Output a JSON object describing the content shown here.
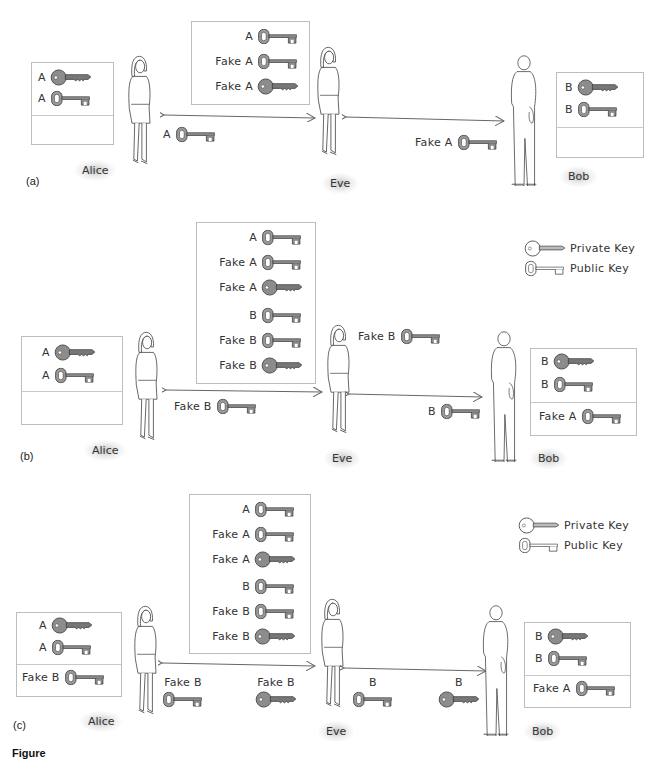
{
  "colors": {
    "private_key_fill": "#8c8c8c",
    "private_key_stroke": "#4a4a4a",
    "public_key_fill": "#9a9a9a",
    "box_border": "#bdbdbd",
    "arrow": "#666666",
    "name_shadow": "#9a9a9a"
  },
  "legend": {
    "private_label": "Private Key",
    "public_label": "Public Key"
  },
  "panels": [
    {
      "tag": "(a)",
      "names": {
        "alice": "Alice",
        "eve": "Eve",
        "bob": "Bob"
      },
      "alice_box": {
        "top_rows": [
          {
            "label": "A",
            "key": "private"
          },
          {
            "label": "A",
            "key": "public"
          }
        ],
        "bottom_rows": []
      },
      "eve_box": {
        "rows": [
          {
            "label": "A",
            "key": "public"
          },
          {
            "label": "Fake A",
            "key": "public"
          },
          {
            "label": "Fake A",
            "key": "private"
          }
        ]
      },
      "bob_box": {
        "top_rows": [
          {
            "label": "B",
            "key": "private"
          },
          {
            "label": "B",
            "key": "public"
          }
        ],
        "bottom_rows": []
      },
      "transfers": [
        {
          "label": "A",
          "key": "public",
          "link": "alice-eve"
        },
        {
          "label": "Fake A",
          "key": "public",
          "link": "eve-bob"
        }
      ]
    },
    {
      "tag": "(b)",
      "names": {
        "alice": "Alice",
        "eve": "Eve",
        "bob": "Bob"
      },
      "alice_box": {
        "top_rows": [
          {
            "label": "A",
            "key": "private"
          },
          {
            "label": "A",
            "key": "public"
          }
        ],
        "bottom_rows": []
      },
      "eve_box": {
        "rows": [
          {
            "label": "A",
            "key": "public"
          },
          {
            "label": "Fake A",
            "key": "public"
          },
          {
            "label": "Fake A",
            "key": "private"
          },
          {
            "label": "B",
            "key": "public"
          },
          {
            "label": "Fake B",
            "key": "public"
          },
          {
            "label": "Fake B",
            "key": "private"
          }
        ]
      },
      "bob_box": {
        "top_rows": [
          {
            "label": "B",
            "key": "private"
          },
          {
            "label": "B",
            "key": "public"
          }
        ],
        "bottom_rows": [
          {
            "label": "Fake A",
            "key": "public"
          }
        ]
      },
      "transfers": [
        {
          "label": "Fake B",
          "key": "public",
          "link": "eve-alice"
        },
        {
          "label": "Fake B",
          "key": "public",
          "link": "eve-near"
        },
        {
          "label": "B",
          "key": "public",
          "link": "bob-eve"
        }
      ]
    },
    {
      "tag": "(c)",
      "names": {
        "alice": "Alice",
        "eve": "Eve",
        "bob": "Bob"
      },
      "alice_box": {
        "top_rows": [
          {
            "label": "A",
            "key": "private"
          },
          {
            "label": "A",
            "key": "public"
          }
        ],
        "bottom_rows": [
          {
            "label": "Fake B",
            "key": "public"
          }
        ]
      },
      "eve_box": {
        "rows": [
          {
            "label": "A",
            "key": "public"
          },
          {
            "label": "Fake A",
            "key": "public"
          },
          {
            "label": "Fake A",
            "key": "private"
          },
          {
            "label": "B",
            "key": "public"
          },
          {
            "label": "Fake B",
            "key": "public"
          },
          {
            "label": "Fake B",
            "key": "private"
          }
        ]
      },
      "bob_box": {
        "top_rows": [
          {
            "label": "B",
            "key": "private"
          },
          {
            "label": "B",
            "key": "public"
          }
        ],
        "bottom_rows": [
          {
            "label": "Fake A",
            "key": "public"
          }
        ]
      },
      "transfers": [
        {
          "label": "Fake B",
          "key": "public",
          "link": "alice-side"
        },
        {
          "label": "Fake B",
          "key": "private",
          "link": "eve-side-left"
        },
        {
          "label": "B",
          "key": "public",
          "link": "eve-side-right"
        },
        {
          "label": "B",
          "key": "private",
          "link": "bob-side"
        }
      ]
    }
  ],
  "caption": "Figure"
}
